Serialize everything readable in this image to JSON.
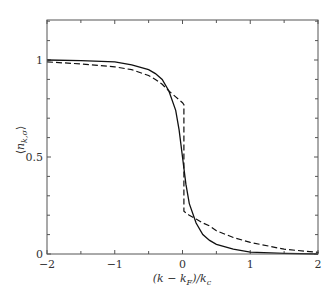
{
  "chart_data": {
    "type": "line",
    "title": "",
    "xlabel": "(k − k_F)/k_c",
    "ylabel": "⟨n_k,σ⟩",
    "xlim": [
      -2,
      2.1
    ],
    "ylim": [
      0,
      1.2
    ],
    "x_ticks": [
      -2,
      -1,
      0,
      1,
      2
    ],
    "x_tick_labels": [
      "−2",
      "−1",
      "0",
      "1",
      "2"
    ],
    "x_minor_step": 0.5,
    "y_ticks": [
      0,
      0.5,
      1
    ],
    "y_tick_labels": [
      "0",
      "0.5",
      "1"
    ],
    "y_minor_step": 0.1,
    "grid": false,
    "legend": null,
    "series": [
      {
        "name": "solid",
        "style": "solid",
        "x": [
          -2.0,
          -1.5,
          -1.0,
          -0.75,
          -0.5,
          -0.4,
          -0.3,
          -0.2,
          -0.1,
          -0.05,
          0.0,
          0.05,
          0.1,
          0.2,
          0.3,
          0.4,
          0.5,
          0.75,
          1.0,
          1.5,
          2.0,
          2.1
        ],
        "y": [
          1.0,
          0.997,
          0.99,
          0.975,
          0.95,
          0.93,
          0.9,
          0.84,
          0.74,
          0.64,
          0.5,
          0.36,
          0.26,
          0.16,
          0.1,
          0.07,
          0.05,
          0.025,
          0.01,
          0.003,
          0.0,
          0.0
        ]
      },
      {
        "name": "dashed",
        "style": "dashed",
        "x": [
          -2.0,
          -1.5,
          -1.0,
          -0.75,
          -0.5,
          -0.4,
          -0.3,
          -0.2,
          -0.1,
          0.0,
          0.02,
          0.02,
          0.1,
          0.2,
          0.3,
          0.4,
          0.5,
          0.75,
          1.0,
          1.5,
          2.0,
          2.1
        ],
        "y": [
          0.99,
          0.98,
          0.965,
          0.95,
          0.92,
          0.9,
          0.875,
          0.84,
          0.81,
          0.78,
          0.77,
          0.22,
          0.2,
          0.18,
          0.16,
          0.145,
          0.12,
          0.085,
          0.06,
          0.025,
          0.008,
          0.005
        ]
      }
    ]
  }
}
